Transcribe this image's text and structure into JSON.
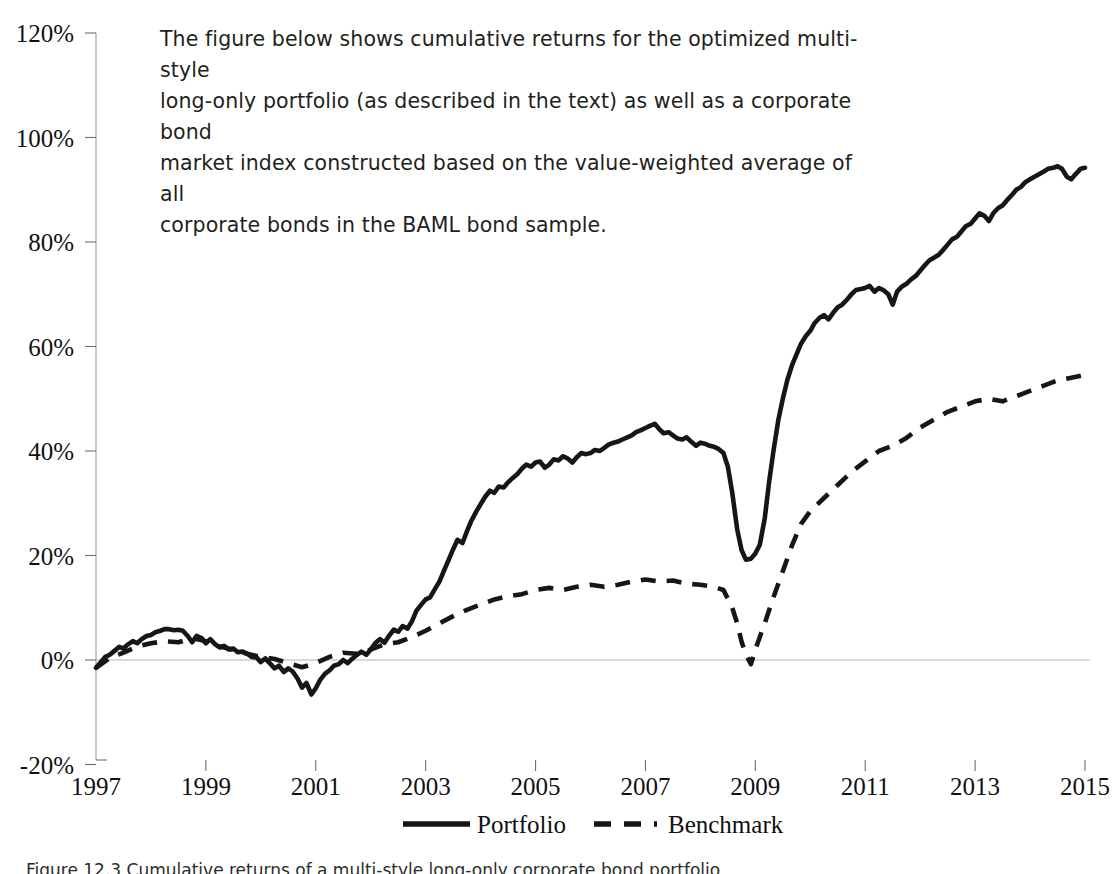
{
  "caption": {
    "lines": [
      "The figure below shows cumulative returns for the optimized multi-style",
      "long-only portfolio (as described in the text) as well as a corporate bond",
      "market index constructed based on the value-weighted average of all",
      "corporate bonds in the BAML bond sample."
    ]
  },
  "figure_caption": "Figure 12.3   Cumulative returns of a multi-style long-only corporate bond portfolio",
  "chart_data": {
    "type": "line",
    "title": "",
    "xlabel": "",
    "ylabel": "",
    "xlim": [
      1997,
      2015
    ],
    "ylim": [
      -20,
      120
    ],
    "ytick_labels": [
      "120%",
      "100%",
      "80%",
      "60%",
      "40%",
      "20%",
      "0%",
      "-20%"
    ],
    "ytick_values": [
      120,
      100,
      80,
      60,
      40,
      20,
      0,
      -20
    ],
    "xtick_labels": [
      "1997",
      "1999",
      "2001",
      "2003",
      "2005",
      "2007",
      "2009",
      "2011",
      "2013",
      "2015"
    ],
    "xtick_values": [
      1997,
      1999,
      2001,
      2003,
      2005,
      2007,
      2009,
      2011,
      2013,
      2015
    ],
    "yunit": "percent",
    "grid": false,
    "zero_line": true,
    "legend_position": "bottom-center",
    "legend": [
      "Portfolio",
      "Benchmark"
    ],
    "series": [
      {
        "name": "Portfolio",
        "style": "solid",
        "color": "#161616",
        "x": [
          1997.0,
          1997.08,
          1997.17,
          1997.25,
          1997.33,
          1997.42,
          1997.5,
          1997.58,
          1997.67,
          1997.75,
          1997.83,
          1997.92,
          1998.0,
          1998.08,
          1998.17,
          1998.25,
          1998.33,
          1998.42,
          1998.5,
          1998.58,
          1998.67,
          1998.75,
          1998.83,
          1998.92,
          1999.0,
          1999.08,
          1999.17,
          1999.25,
          1999.33,
          1999.42,
          1999.5,
          1999.58,
          1999.67,
          1999.75,
          1999.83,
          1999.92,
          2000.0,
          2000.08,
          2000.17,
          2000.25,
          2000.33,
          2000.42,
          2000.5,
          2000.58,
          2000.67,
          2000.75,
          2000.83,
          2000.92,
          2001.0,
          2001.08,
          2001.17,
          2001.25,
          2001.33,
          2001.42,
          2001.5,
          2001.58,
          2001.67,
          2001.75,
          2001.83,
          2001.92,
          2002.0,
          2002.08,
          2002.17,
          2002.25,
          2002.33,
          2002.42,
          2002.5,
          2002.58,
          2002.67,
          2002.75,
          2002.83,
          2002.92,
          2003.0,
          2003.08,
          2003.17,
          2003.25,
          2003.33,
          2003.42,
          2003.5,
          2003.58,
          2003.67,
          2003.75,
          2003.83,
          2003.92,
          2004.0,
          2004.08,
          2004.17,
          2004.25,
          2004.33,
          2004.42,
          2004.5,
          2004.58,
          2004.67,
          2004.75,
          2004.83,
          2004.92,
          2005.0,
          2005.08,
          2005.17,
          2005.25,
          2005.33,
          2005.42,
          2005.5,
          2005.58,
          2005.67,
          2005.75,
          2005.83,
          2005.92,
          2006.0,
          2006.08,
          2006.17,
          2006.25,
          2006.33,
          2006.42,
          2006.5,
          2006.58,
          2006.67,
          2006.75,
          2006.83,
          2006.92,
          2007.0,
          2007.08,
          2007.17,
          2007.25,
          2007.33,
          2007.42,
          2007.5,
          2007.58,
          2007.67,
          2007.75,
          2007.83,
          2007.92,
          2008.0,
          2008.08,
          2008.17,
          2008.25,
          2008.33,
          2008.42,
          2008.5,
          2008.58,
          2008.67,
          2008.75,
          2008.83,
          2008.92,
          2009.0,
          2009.08,
          2009.17,
          2009.25,
          2009.33,
          2009.42,
          2009.5,
          2009.58,
          2009.67,
          2009.75,
          2009.83,
          2009.92,
          2010.0,
          2010.08,
          2010.17,
          2010.25,
          2010.33,
          2010.42,
          2010.5,
          2010.58,
          2010.67,
          2010.75,
          2010.83,
          2010.92,
          2011.0,
          2011.08,
          2011.17,
          2011.25,
          2011.33,
          2011.42,
          2011.5,
          2011.58,
          2011.67,
          2011.75,
          2011.83,
          2011.92,
          2012.0,
          2012.08,
          2012.17,
          2012.25,
          2012.33,
          2012.42,
          2012.5,
          2012.58,
          2012.67,
          2012.75,
          2012.83,
          2012.92,
          2013.0,
          2013.08,
          2013.17,
          2013.25,
          2013.33,
          2013.42,
          2013.5,
          2013.58,
          2013.67,
          2013.75,
          2013.83,
          2013.92,
          2014.0,
          2014.08,
          2014.17,
          2014.25,
          2014.33,
          2014.42,
          2014.5,
          2014.58,
          2014.67,
          2014.75,
          2014.83,
          2014.92,
          2015.0
        ],
        "y": [
          -1.5,
          -0.5,
          0.6,
          1.0,
          1.7,
          2.5,
          2.2,
          3.0,
          3.6,
          3.2,
          4.0,
          4.6,
          4.8,
          5.3,
          5.6,
          5.9,
          5.9,
          5.7,
          5.8,
          5.6,
          4.6,
          3.4,
          4.6,
          4.2,
          3.2,
          4.0,
          3.0,
          2.4,
          2.7,
          2.0,
          2.2,
          1.5,
          1.6,
          1.2,
          0.6,
          0.5,
          -0.4,
          0.3,
          -0.7,
          -1.6,
          -1.1,
          -2.3,
          -1.6,
          -2.2,
          -3.6,
          -5.3,
          -4.4,
          -6.6,
          -5.4,
          -3.8,
          -2.6,
          -2.0,
          -1.1,
          -0.8,
          0.0,
          -0.6,
          0.3,
          1.0,
          1.6,
          1.0,
          2.0,
          3.2,
          4.0,
          3.3,
          4.6,
          5.8,
          5.4,
          6.5,
          6.0,
          7.4,
          9.4,
          10.6,
          11.6,
          12.0,
          13.6,
          15.0,
          17.0,
          19.2,
          21.2,
          23.0,
          22.4,
          24.6,
          26.6,
          28.4,
          29.8,
          31.2,
          32.4,
          32.0,
          33.2,
          33.0,
          34.0,
          34.8,
          35.6,
          36.6,
          37.4,
          37.0,
          37.8,
          38.0,
          36.8,
          37.4,
          38.4,
          38.2,
          39.0,
          38.6,
          37.8,
          38.8,
          39.6,
          39.4,
          39.6,
          40.2,
          40.0,
          40.6,
          41.2,
          41.6,
          41.8,
          42.2,
          42.6,
          43.0,
          43.6,
          44.0,
          44.4,
          44.8,
          45.2,
          44.2,
          43.4,
          43.6,
          43.0,
          42.4,
          42.2,
          42.6,
          41.8,
          41.0,
          41.6,
          41.4,
          41.0,
          40.8,
          40.4,
          39.6,
          37.0,
          32.0,
          25.0,
          21.0,
          19.2,
          19.4,
          20.4,
          22.0,
          27.0,
          34.0,
          40.0,
          46.0,
          50.0,
          53.5,
          56.5,
          58.5,
          60.5,
          62.0,
          63.0,
          64.5,
          65.5,
          66.0,
          65.2,
          66.5,
          67.5,
          68.0,
          69.0,
          70.0,
          70.8,
          71.0,
          71.2,
          71.6,
          70.5,
          71.2,
          70.8,
          70.0,
          68.0,
          70.5,
          71.5,
          72.0,
          72.8,
          73.5,
          74.5,
          75.5,
          76.5,
          77.0,
          77.5,
          78.5,
          79.5,
          80.5,
          81.0,
          82.0,
          83.0,
          83.5,
          84.5,
          85.5,
          85.0,
          84.0,
          85.5,
          86.5,
          87.0,
          88.0,
          89.0,
          90.0,
          90.5,
          91.5,
          92.0,
          92.5,
          93.0,
          93.5,
          94.0,
          94.2,
          94.5,
          94.0,
          92.5,
          92.0,
          93.0,
          94.0,
          94.2
        ]
      },
      {
        "name": "Benchmark",
        "style": "dashed",
        "color": "#161616",
        "x": [
          1997.0,
          1997.25,
          1997.5,
          1997.75,
          1998.0,
          1998.25,
          1998.5,
          1998.75,
          1999.0,
          1999.25,
          1999.5,
          1999.75,
          2000.0,
          2000.25,
          2000.5,
          2000.75,
          2001.0,
          2001.25,
          2001.5,
          2001.75,
          2002.0,
          2002.25,
          2002.5,
          2002.75,
          2003.0,
          2003.25,
          2003.5,
          2003.75,
          2004.0,
          2004.25,
          2004.5,
          2004.75,
          2005.0,
          2005.25,
          2005.5,
          2005.75,
          2006.0,
          2006.25,
          2006.5,
          2006.75,
          2007.0,
          2007.25,
          2007.5,
          2007.75,
          2008.0,
          2008.25,
          2008.42,
          2008.58,
          2008.67,
          2008.75,
          2008.83,
          2008.92,
          2009.0,
          2009.17,
          2009.33,
          2009.5,
          2009.67,
          2009.83,
          2010.0,
          2010.25,
          2010.5,
          2010.75,
          2011.0,
          2011.25,
          2011.5,
          2011.75,
          2012.0,
          2012.25,
          2012.5,
          2012.75,
          2013.0,
          2013.25,
          2013.5,
          2013.75,
          2014.0,
          2014.25,
          2014.5,
          2014.75,
          2015.0
        ],
        "y": [
          -1.5,
          0.4,
          1.4,
          2.6,
          3.2,
          3.6,
          3.4,
          4.2,
          3.6,
          2.6,
          2.0,
          1.2,
          0.6,
          0.2,
          -0.6,
          -1.4,
          -0.6,
          0.6,
          1.4,
          1.2,
          2.0,
          3.0,
          3.4,
          4.4,
          5.6,
          7.0,
          8.4,
          9.6,
          10.6,
          11.6,
          12.2,
          12.6,
          13.4,
          13.8,
          13.4,
          14.0,
          14.4,
          14.0,
          14.4,
          15.0,
          15.4,
          15.0,
          15.2,
          14.6,
          14.4,
          14.0,
          13.4,
          10.0,
          7.0,
          3.5,
          1.0,
          -0.8,
          2.0,
          7.0,
          12.0,
          17.0,
          22.0,
          26.0,
          28.5,
          31.0,
          33.5,
          36.0,
          38.0,
          40.0,
          41.0,
          42.5,
          44.5,
          46.0,
          47.5,
          48.5,
          49.5,
          50.0,
          49.5,
          50.5,
          51.5,
          52.5,
          53.5,
          54.0,
          54.6
        ]
      }
    ],
    "annotations": {
      "portfolio_final": 94.2,
      "benchmark_final": 54.6,
      "portfolio_peak_2007": 45.2,
      "portfolio_trough_2008": 19.2,
      "benchmark_trough_2008": -0.8
    }
  }
}
